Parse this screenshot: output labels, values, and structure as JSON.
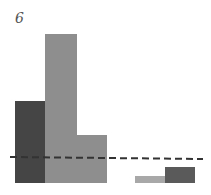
{
  "panel_label": "6",
  "chart_data": {
    "type": "bar",
    "title": "",
    "xlabel": "",
    "ylabel": "",
    "categories": [
      "1",
      "2",
      "3",
      "4",
      "5",
      "6"
    ],
    "series": [
      {
        "name": "bars",
        "values": [
          82,
          149,
          48,
          0,
          7,
          16
        ]
      }
    ],
    "bar_colors": [
      "#454545",
      "#8e8e8e",
      "#8e8e8e",
      "#ffffff",
      "#a8a8a8",
      "#5a5a5a"
    ],
    "reference_line": {
      "style": "dashed",
      "value": 25,
      "color": "#333333"
    },
    "grid": false,
    "legend": null
  },
  "layout": {
    "baseline_y": 183,
    "bars_px": [
      {
        "x": 15,
        "w": 30,
        "top": 101,
        "color": "#454545"
      },
      {
        "x": 45,
        "w": 32,
        "top": 34,
        "color": "#8e8e8e"
      },
      {
        "x": 77,
        "w": 30,
        "top": 135,
        "color": "#8e8e8e"
      },
      {
        "x": 135,
        "w": 30,
        "top": 176,
        "color": "#a8a8a8"
      },
      {
        "x": 165,
        "w": 30,
        "top": 167,
        "color": "#5a5a5a"
      }
    ],
    "dash": {
      "x1": 10,
      "y1": 157,
      "x2": 203,
      "y2": 159
    }
  }
}
